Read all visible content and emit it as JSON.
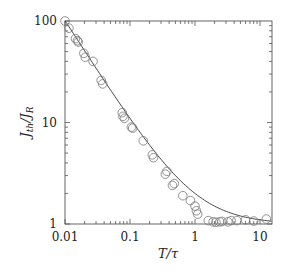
{
  "chart_data": {
    "type": "scatter",
    "title": "",
    "xlabel": "T/τ",
    "ylabel": "J_th/J_R",
    "xscale": "log",
    "yscale": "log",
    "xlim": [
      0.01,
      15
    ],
    "ylim": [
      1,
      100
    ],
    "grid": false,
    "legend": null,
    "x_ticks": [
      0.01,
      0.1,
      1,
      10
    ],
    "x_tick_labels": [
      "0.01",
      "0.1",
      "1",
      "10"
    ],
    "y_ticks": [
      1,
      10,
      100
    ],
    "y_tick_labels": [
      "1",
      "10",
      "100"
    ],
    "series": [
      {
        "name": "data",
        "marker": "open-circle",
        "points": [
          [
            0.01,
            100
          ],
          [
            0.0115,
            85
          ],
          [
            0.0145,
            67
          ],
          [
            0.0155,
            64
          ],
          [
            0.016,
            62
          ],
          [
            0.0195,
            48
          ],
          [
            0.0205,
            44
          ],
          [
            0.027,
            40
          ],
          [
            0.036,
            26
          ],
          [
            0.038,
            24
          ],
          [
            0.076,
            12.5
          ],
          [
            0.078,
            11.5
          ],
          [
            0.082,
            11
          ],
          [
            0.105,
            9.0
          ],
          [
            0.11,
            8.8
          ],
          [
            0.16,
            6.6
          ],
          [
            0.22,
            4.8
          ],
          [
            0.23,
            4.5
          ],
          [
            0.35,
            3.1
          ],
          [
            0.37,
            3.3
          ],
          [
            0.45,
            2.4
          ],
          [
            0.48,
            2.5
          ],
          [
            0.65,
            1.9
          ],
          [
            0.85,
            1.7
          ],
          [
            1.0,
            1.5
          ],
          [
            1.05,
            1.35
          ],
          [
            1.1,
            1.25
          ],
          [
            1.6,
            1.08
          ],
          [
            1.9,
            1.05
          ],
          [
            2.1,
            1.04
          ],
          [
            2.4,
            1.05
          ],
          [
            2.6,
            1.06
          ],
          [
            3.2,
            1.05
          ],
          [
            3.6,
            1.08
          ],
          [
            4.4,
            1.08
          ],
          [
            6.0,
            1.1
          ],
          [
            8.0,
            1.07
          ],
          [
            12.5,
            1.12
          ]
        ]
      },
      {
        "name": "fit",
        "style": "solid-line",
        "formula": "1 + (T/τ)^-1",
        "x": [
          0.01,
          0.02,
          0.05,
          0.1,
          0.2,
          0.5,
          1,
          2,
          5,
          10,
          15
        ],
        "values": [
          101,
          51,
          21,
          11,
          6,
          3,
          2,
          1.5,
          1.2,
          1.1,
          1.067
        ]
      }
    ]
  }
}
